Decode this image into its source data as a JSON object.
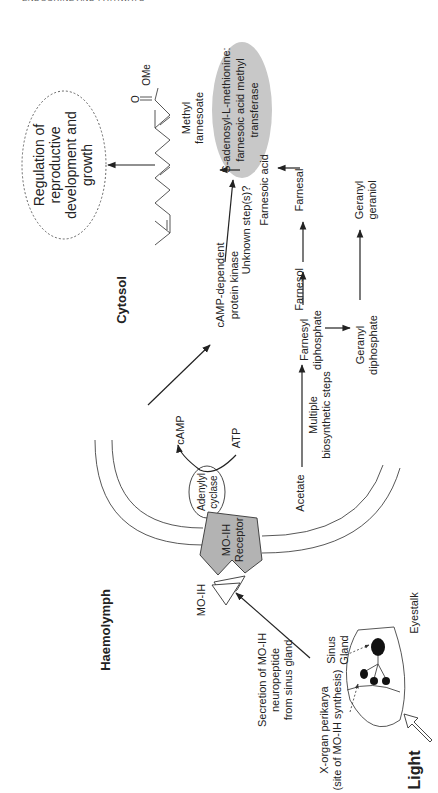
{
  "page": {
    "running_head": "ENDOCRINE AND PATHWAYS"
  },
  "diagram": {
    "orientation": "rotated 90 degrees counter-clockwise",
    "regions": {
      "haemolymph": "Haemolymph",
      "cytosol": "Cytosol"
    },
    "eyestalk": {
      "label": "Eyestalk",
      "sinus_gland": [
        "Sinus",
        "Gland"
      ],
      "x_organ": [
        "X-organ perikarya",
        "(site of MO-IH synthesis)"
      ],
      "light": "Light",
      "secretion": [
        "Secretion of MO-IH",
        "neuropeptide",
        "from sinus gland"
      ]
    },
    "membrane": {
      "ligand": "MO-IH",
      "receptor": [
        "MO-IH",
        "Receptor"
      ],
      "enzyme": [
        "Adenylyl",
        "cyclase"
      ],
      "atp": "ATP",
      "camp": "cAMP"
    },
    "signaling": {
      "kinase": [
        "cAMP-dependent",
        "protein kinase"
      ],
      "unknown": "Unknown step(s)?"
    },
    "pathway": {
      "acetate": "Acetate",
      "multi_steps": [
        "Multiple",
        "biosynthetic steps"
      ],
      "farnesyl_dp": [
        "Farnesyl",
        "diphosphate"
      ],
      "geranyl_dp": [
        "Geranyl",
        "diphosphate"
      ],
      "geranyl_geraniol": [
        "Geranyl",
        "geraniol"
      ],
      "farnesol": "Farnesol",
      "farnesal": "Farnesal",
      "farnesoic_acid": "Farnesoic acid",
      "enzyme": [
        "S-adenosyl-L-methionine:",
        "farnesoic acid methyl",
        "transferase"
      ],
      "methyl_farnesoate": [
        "Methyl",
        "farnesoate"
      ],
      "ome": "OMe",
      "o": "O"
    },
    "outcome": [
      "Regulation of",
      "reproductive",
      "development and",
      "growth"
    ],
    "colors": {
      "line": "#222222",
      "receptor_fill": "#b3b3b3",
      "enzyme_fill": "#c8c8c8",
      "background": "#ffffff"
    }
  }
}
